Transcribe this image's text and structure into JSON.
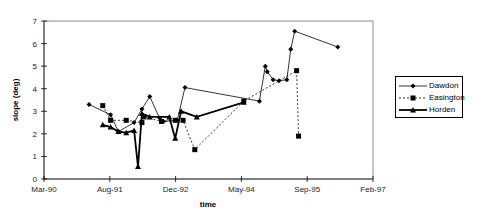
{
  "chart_data": {
    "type": "line",
    "title": "",
    "xlabel": "time",
    "ylabel": "slope (deg)",
    "ylim": [
      0,
      7
    ],
    "yticks": [
      0,
      1,
      2,
      3,
      4,
      5,
      6,
      7
    ],
    "xticks": [
      "Mar-90",
      "Aug-91",
      "Dec-92",
      "May-94",
      "Sep-95",
      "Feb-97"
    ],
    "grid": false,
    "legend_position": "right",
    "x_unit": "months since Mar-90",
    "series": [
      {
        "name": "Dawdon",
        "style": "solid-thin",
        "marker": "diamond",
        "points": [
          [
            11.5,
            3.3
          ],
          [
            17,
            2.85
          ],
          [
            19,
            2.1
          ],
          [
            23,
            2.5
          ],
          [
            25,
            3.1
          ],
          [
            27,
            3.65
          ],
          [
            29.5,
            2.7
          ],
          [
            30.5,
            2.55
          ],
          [
            34,
            2.6
          ],
          [
            36,
            4.05
          ],
          [
            55,
            3.45
          ],
          [
            56.5,
            5.0
          ],
          [
            57,
            4.75
          ],
          [
            58.5,
            4.4
          ],
          [
            60,
            4.35
          ],
          [
            62,
            4.4
          ],
          [
            63,
            5.75
          ],
          [
            64,
            6.55
          ],
          [
            75,
            5.85
          ]
        ]
      },
      {
        "name": "Easington",
        "style": "dashed",
        "marker": "square",
        "points": [
          [
            15,
            3.25
          ],
          [
            17,
            2.6
          ],
          [
            21,
            2.6
          ],
          [
            25,
            2.5
          ],
          [
            25.5,
            2.75
          ],
          [
            30,
            2.55
          ],
          [
            33.5,
            2.6
          ],
          [
            35.5,
            2.6
          ],
          [
            38.5,
            1.3
          ],
          [
            51,
            3.45
          ],
          [
            64.5,
            4.8
          ],
          [
            65,
            1.9
          ]
        ]
      },
      {
        "name": "Horden",
        "style": "solid-thick",
        "marker": "triangle",
        "points": [
          [
            15,
            2.4
          ],
          [
            17,
            2.3
          ],
          [
            19,
            2.1
          ],
          [
            21,
            2.05
          ],
          [
            23,
            2.15
          ],
          [
            24,
            0.55
          ],
          [
            25,
            2.9
          ],
          [
            27,
            2.75
          ],
          [
            32,
            2.75
          ],
          [
            33.5,
            1.8
          ],
          [
            35,
            3.0
          ],
          [
            39,
            2.75
          ],
          [
            51,
            3.4
          ]
        ]
      }
    ]
  },
  "axes": {
    "ylabel": "slope (deg)",
    "xlabel": "time",
    "y_tick_labels": [
      "0",
      "1",
      "2",
      "3",
      "4",
      "5",
      "6",
      "7"
    ],
    "x_tick_labels": [
      "Mar-90",
      "Aug-91",
      "Dec-92",
      "May-94",
      "Sep-95",
      "Feb-97"
    ]
  },
  "legend": {
    "items": [
      {
        "label": "Dawdon"
      },
      {
        "label": "Easington"
      },
      {
        "label": "Horden"
      }
    ]
  }
}
